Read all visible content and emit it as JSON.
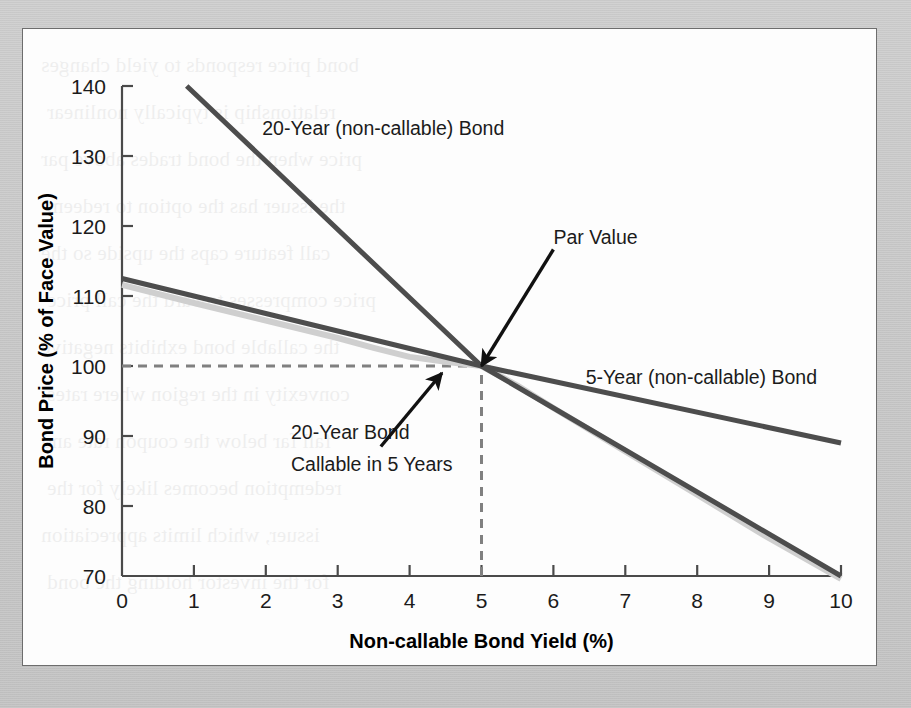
{
  "figure": {
    "background_color": "#c9c9c9",
    "panel_color": "#fdfdfd",
    "border_color": "#6d6d6d"
  },
  "ghost_lines": [
    "bond price responds to yield changes",
    "relationship is typically nonlinear",
    "price when the bond trades above par",
    "the issuer has the option to redeem",
    "call feature caps the upside so the",
    "price compresses toward the call price",
    "the callable bond exhibits negative",
    "convexity in the region where rates",
    "fall far below the coupon rate and",
    "redemption becomes likely for the",
    "issuer, which limits appreciation",
    "for the investor holding the bond"
  ],
  "chart_data": {
    "type": "line",
    "title": "",
    "subtitle": "",
    "xlabel": "Non-callable Bond Yield (%)",
    "ylabel": "Bond Price (% of Face Value)",
    "xlim": [
      0,
      10
    ],
    "ylim": [
      70,
      140
    ],
    "xticks": [
      "0",
      "1",
      "2",
      "3",
      "4",
      "5",
      "6",
      "7",
      "8",
      "9",
      "10"
    ],
    "yticks": [
      "70",
      "80",
      "90",
      "100",
      "110",
      "120",
      "130",
      "140"
    ],
    "grid": false,
    "legend_position": "inline-annotations",
    "series": [
      {
        "name": "20-Year (non-callable) Bond",
        "color": "#4d4d4d",
        "width": 5,
        "x": [
          0.9,
          5.0,
          10.0
        ],
        "values": [
          140.0,
          100.0,
          70.0
        ]
      },
      {
        "name": "5-Year (non-callable) Bond",
        "color": "#4d4d4d",
        "width": 5,
        "x": [
          0.0,
          5.0,
          10.0
        ],
        "values": [
          112.5,
          100.0,
          89.0
        ]
      },
      {
        "name": "20-Year Bond Callable in 5 Years",
        "color": "#cfcfcf",
        "width": 6,
        "x": [
          0.0,
          1.0,
          2.0,
          3.0,
          3.5,
          4.0,
          4.5,
          5.0,
          5.5,
          6.0,
          7.0,
          8.0,
          9.0,
          10.0
        ],
        "values": [
          111.6,
          109.0,
          106.5,
          104.0,
          102.6,
          101.3,
          100.6,
          100.0,
          97.2,
          94.0,
          87.8,
          81.6,
          75.4,
          69.6
        ]
      }
    ],
    "reference_lines": [
      {
        "name": "par-value-horizontal",
        "orientation": "horizontal",
        "value": 100,
        "style": "dashed",
        "color": "#808080",
        "from_x": 0,
        "to_x": 5.12
      },
      {
        "name": "par-value-vertical",
        "orientation": "vertical",
        "value": 5,
        "style": "dashed",
        "color": "#808080",
        "from_y": 70,
        "to_y": 100
      }
    ],
    "annotations": [
      {
        "name": "par-value",
        "text": "Par Value",
        "x": 6.0,
        "y": 117.5,
        "arrow_to": {
          "x": 5.0,
          "y": 100.0
        }
      },
      {
        "name": "twenty-year-noncallable",
        "text": "20-Year (non-callable) Bond",
        "x": 1.95,
        "y": 133.0
      },
      {
        "name": "five-year-noncallable",
        "text": "5-Year (non-callable) Bond",
        "x": 6.45,
        "y": 97.5
      },
      {
        "name": "twenty-year-callable-line1",
        "text": "20-Year Bond",
        "x": 2.35,
        "y": 89.6
      },
      {
        "name": "twenty-year-callable-line2",
        "text": "Callable in 5 Years",
        "x": 2.35,
        "y": 85.0
      },
      {
        "name": "twenty-year-callable-arrow",
        "text": "",
        "x": 3.6,
        "y": 88.5,
        "arrow_to": {
          "x": 4.45,
          "y": 99.0
        }
      }
    ]
  }
}
